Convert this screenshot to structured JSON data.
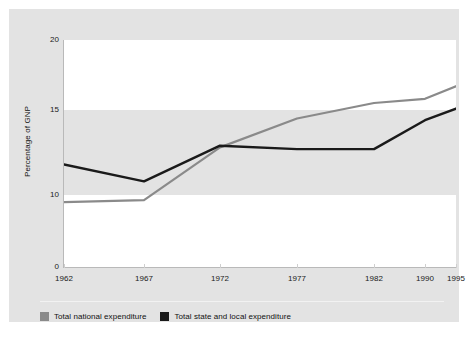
{
  "captions": {
    "top": "",
    "bottom": ""
  },
  "chart_data": {
    "type": "line",
    "title": "",
    "xlabel": "",
    "ylabel": "Percentage of GNP",
    "categories": [
      "1962",
      "1967",
      "1972",
      "1977",
      "1982",
      "1990",
      "1995"
    ],
    "x_positions_px": [
      0,
      80,
      156,
      233,
      310,
      361,
      392
    ],
    "y_ticks": [
      0,
      10,
      15,
      20
    ],
    "y_tick_positions_px": [
      227,
      155,
      70,
      0
    ],
    "ylim": [
      0,
      20
    ],
    "grid": false,
    "axis_note": "non-linear / compressed y-axis below 10",
    "legend_position": "bottom-left",
    "series": [
      {
        "name": "Total national expenditure",
        "color": "#8a8a8a",
        "values": [
          9.0,
          9.3,
          12.8,
          14.5,
          15.5,
          15.8,
          16.7
        ]
      },
      {
        "name": "Total state and local expenditure",
        "color": "#1a1a1a",
        "values": [
          11.8,
          10.8,
          12.9,
          12.7,
          12.7,
          14.4,
          15.1
        ]
      }
    ]
  },
  "legend": {
    "items": [
      {
        "label": "Total national expenditure",
        "color": "#8a8a8a"
      },
      {
        "label": "Total state and local expenditure",
        "color": "#1a1a1a"
      }
    ]
  }
}
